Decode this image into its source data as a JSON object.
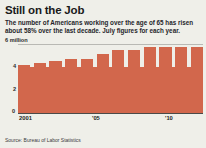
{
  "headline": "Still on the Job",
  "deck": "The number of Americans working over the age of 65 has risen about 58% over the last decade. July figures for each year.",
  "source": "Source: Bureau of Labor Statistics",
  "colors": {
    "bar": "#d2674c",
    "background": "#efefe9",
    "text": "#1a1a1a",
    "axis": "#4a4a48",
    "grid": "#b9b9b4"
  },
  "axis_unit_label": "6 million",
  "y_ticks": [
    {
      "label": "6 million",
      "value": 6
    },
    {
      "label": "4",
      "value": 4
    },
    {
      "label": "2",
      "value": 2
    },
    {
      "label": "0",
      "value": 0
    }
  ],
  "x_ticks": [
    {
      "label": "2001",
      "index": 0
    },
    {
      "label": "'05",
      "index": 4
    },
    {
      "label": "'10",
      "index": 9
    }
  ],
  "chart_data": {
    "type": "bar",
    "title": "Still on the Job",
    "subtitle": "The number of Americans working over the age of 65 has risen about 58% over the last decade. July figures for each year.",
    "xlabel": "",
    "ylabel": "6 million",
    "ylim": [
      0,
      6
    ],
    "grid": true,
    "legend": "none",
    "source": "Source: Bureau of Labor Statistics",
    "categories": [
      "2001",
      "2002",
      "2003",
      "2004",
      "'05",
      "2006",
      "2007",
      "2008",
      "2009",
      "'10",
      "2011",
      "2012"
    ],
    "values": [
      4.05,
      4.2,
      4.35,
      4.6,
      4.75,
      4.75,
      5.15,
      5.55,
      5.5,
      5.75,
      5.75,
      5.8
    ],
    "tick_labels_shown": [
      "2001",
      "'05",
      "'10"
    ]
  }
}
